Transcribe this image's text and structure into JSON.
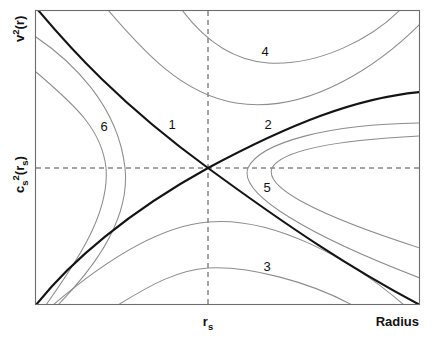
{
  "figure": {
    "axes": {
      "y_label_main": "v",
      "y_label_sup": "2",
      "y_label_arg": "(r)",
      "y_label_full": "v²(r)",
      "y_crit_main": "c",
      "y_crit_sub": "s",
      "y_crit_sup": "2",
      "y_crit_arg_open": "(r",
      "y_crit_arg_sub": "s",
      "y_crit_arg_close": ")",
      "y_crit_full": "cₛ²(rₛ)",
      "x_crit_main": "r",
      "x_crit_sub": "s",
      "x_crit_full": "rₛ",
      "x_label": "Radius"
    },
    "curve_labels": [
      {
        "id": "1",
        "text": "1",
        "x": 172,
        "y": 129
      },
      {
        "id": "2",
        "text": "2",
        "x": 268,
        "y": 129
      },
      {
        "id": "3",
        "text": "3",
        "x": 267,
        "y": 271
      },
      {
        "id": "4",
        "text": "4",
        "x": 265,
        "y": 56
      },
      {
        "id": "5",
        "text": "5",
        "x": 267,
        "y": 192
      },
      {
        "id": "6",
        "text": "6",
        "x": 104,
        "y": 131
      }
    ],
    "colors": {
      "frame": "#6d6d6d",
      "guide": "#4a4a4a",
      "thin_curve": "#8c8c8c",
      "bold_curve": "#141414",
      "background": "#ffffff",
      "text": "#111111"
    }
  },
  "chart_data": {
    "type": "line",
    "xlabel": "Radius",
    "ylabel": "v²(r)",
    "grid": false,
    "legend": "none",
    "xlim": [
      35,
      420
    ],
    "ylim": [
      305,
      10
    ],
    "critical_point": {
      "x": 208,
      "y": 168,
      "x_label": "rₛ",
      "y_label": "cₛ²(rₛ)"
    },
    "guides": [
      {
        "name": "vertical-critical-radius",
        "orientation": "vertical",
        "value": 208,
        "style": "dashed"
      },
      {
        "name": "horizontal-critical-speed",
        "orientation": "horizontal",
        "value": 168,
        "style": "dashed"
      }
    ],
    "series": [
      {
        "name": "1",
        "description": "transonic wind solution (bold, decreasing branch through critical point)",
        "emphasis": "bold",
        "path": "M 38 10 C 70 48, 120 104, 208 168 C 290 228, 350 268, 420 305"
      },
      {
        "name": "2",
        "description": "transonic accretion solution (bold, increasing branch through critical point)",
        "emphasis": "bold",
        "path": "M 36 305 C 70 262, 128 212, 208 168 C 290 124, 356 98, 420 92"
      },
      {
        "name": "3",
        "description": "subsonic everywhere, breeze family below critical point (downward-opening branch)",
        "emphasis": "thin",
        "path": "M 118 305 C 152 284, 178 270, 208 268 C 250 266, 310 282, 352 305"
      },
      {
        "name": "4",
        "description": "supersonic everywhere family above critical point (upward-opening branch)",
        "emphasis": "thin",
        "path": "M 182 10 C 200 34, 228 60, 268 63 C 320 66, 372 38, 400 10"
      },
      {
        "name": "5",
        "description": "double-valued family right of critical point (rightward-opening branch)",
        "emphasis": "thin",
        "path": "M 420 136 C 340 140, 282 150, 272 168 C 264 188, 320 216, 420 248"
      },
      {
        "name": "6",
        "description": "double-valued family left of critical point (leftward-opening branch)",
        "emphasis": "thin",
        "path": "M 36 37 C 70 60, 118 104, 125 168 C 131 224, 86 276, 58 305"
      },
      {
        "name": "3-outer",
        "description": "outer member of breeze family 3",
        "emphasis": "thin",
        "path": "M 53 305 C 108 258, 160 226, 208 222 C 272 216, 350 258, 404 305"
      },
      {
        "name": "4-outer",
        "description": "outer member of supersonic family 4",
        "emphasis": "thin",
        "path": "M 108 10 C 144 52, 182 94, 236 103 C 310 115, 382 62, 420 24"
      },
      {
        "name": "5-outer",
        "description": "outer member of right-hand family 5",
        "emphasis": "thin",
        "path": "M 420 123 C 330 124, 260 142, 248 168 C 238 194, 310 236, 420 278"
      },
      {
        "name": "6-outer",
        "description": "outer member of left-hand family 6",
        "emphasis": "thin",
        "path": "M 36 72 C 76 106, 102 130, 106 168 C 110 216, 72 268, 46 305"
      }
    ]
  }
}
